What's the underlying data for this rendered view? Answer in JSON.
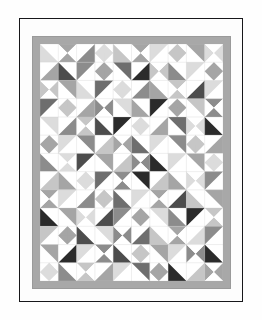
{
  "artwork": {
    "title": "Triangle Pinwheel Quilt",
    "medium": "pattern illustration",
    "frame_color": "#17171a",
    "mat_color": "#fdfdfd",
    "page_background": "#fefefe"
  },
  "quilt": {
    "border_color": "#a8a8a8",
    "field_background": "#ffffff",
    "grid_line_color": "#c8c8c8",
    "columns": 10,
    "rows": 13,
    "cell_size": 18.5,
    "palette": {
      "white": "#ffffff",
      "light": "#dcdcdc",
      "light_mid": "#c6c6c6",
      "mid": "#a5a5a5",
      "mid_dark": "#8c8c8c",
      "dark": "#6e6e6e",
      "darker": "#4d4d4d",
      "near_black": "#2b2b2b"
    },
    "tone_keys": [
      "white",
      "light",
      "light_mid",
      "mid",
      "mid_dark",
      "dark",
      "darker",
      "near_black"
    ],
    "units": [
      {
        "r": 0,
        "c": 0,
        "k": "hst",
        "o": 2,
        "a": "light",
        "b": "white"
      },
      {
        "r": 0,
        "c": 1,
        "k": "hour",
        "o": 0,
        "a": "mid",
        "b": "white"
      },
      {
        "r": 0,
        "c": 2,
        "k": "hst",
        "o": 1,
        "a": "mid_dark",
        "b": "white"
      },
      {
        "r": 0,
        "c": 3,
        "k": "diam",
        "o": 0,
        "a": "light",
        "b": "white"
      },
      {
        "r": 0,
        "c": 4,
        "k": "hst",
        "o": 2,
        "a": "light_mid",
        "b": "white"
      },
      {
        "r": 0,
        "c": 5,
        "k": "hour",
        "o": 0,
        "a": "mid",
        "b": "white"
      },
      {
        "r": 0,
        "c": 6,
        "k": "hst",
        "o": 3,
        "a": "light",
        "b": "white"
      },
      {
        "r": 0,
        "c": 7,
        "k": "diam",
        "o": 0,
        "a": "light_mid",
        "b": "white"
      },
      {
        "r": 0,
        "c": 8,
        "k": "hst",
        "o": 0,
        "a": "mid",
        "b": "white"
      },
      {
        "r": 0,
        "c": 9,
        "k": "hour",
        "o": 1,
        "a": "light",
        "b": "white"
      },
      {
        "r": 1,
        "c": 0,
        "k": "hst",
        "o": 1,
        "a": "mid",
        "b": "white"
      },
      {
        "r": 1,
        "c": 1,
        "k": "hst",
        "o": 2,
        "a": "darker",
        "b": "white"
      },
      {
        "r": 1,
        "c": 2,
        "k": "hst",
        "o": 3,
        "a": "mid_dark",
        "b": "white"
      },
      {
        "r": 1,
        "c": 3,
        "k": "diam",
        "o": 0,
        "a": "mid",
        "b": "white"
      },
      {
        "r": 1,
        "c": 4,
        "k": "hst",
        "o": 0,
        "a": "dark",
        "b": "white"
      },
      {
        "r": 1,
        "c": 5,
        "k": "hst",
        "o": 1,
        "a": "near_black",
        "b": "white"
      },
      {
        "r": 1,
        "c": 6,
        "k": "hour",
        "o": 1,
        "a": "light_mid",
        "b": "white"
      },
      {
        "r": 1,
        "c": 7,
        "k": "hst",
        "o": 2,
        "a": "mid_dark",
        "b": "white"
      },
      {
        "r": 1,
        "c": 8,
        "k": "hst",
        "o": 3,
        "a": "light",
        "b": "white"
      },
      {
        "r": 1,
        "c": 9,
        "k": "diam",
        "o": 0,
        "a": "mid",
        "b": "white"
      },
      {
        "r": 2,
        "c": 0,
        "k": "hour",
        "o": 1,
        "a": "light_mid",
        "b": "white"
      },
      {
        "r": 2,
        "c": 1,
        "k": "hst",
        "o": 0,
        "a": "mid",
        "b": "white"
      },
      {
        "r": 2,
        "c": 2,
        "k": "hst",
        "o": 2,
        "a": "light",
        "b": "white"
      },
      {
        "r": 2,
        "c": 3,
        "k": "hst",
        "o": 3,
        "a": "dark",
        "b": "white"
      },
      {
        "r": 2,
        "c": 4,
        "k": "diam",
        "o": 0,
        "a": "light",
        "b": "white"
      },
      {
        "r": 2,
        "c": 5,
        "k": "hst",
        "o": 1,
        "a": "mid_dark",
        "b": "white"
      },
      {
        "r": 2,
        "c": 6,
        "k": "hst",
        "o": 2,
        "a": "mid",
        "b": "white"
      },
      {
        "r": 2,
        "c": 7,
        "k": "hour",
        "o": 0,
        "a": "light_mid",
        "b": "white"
      },
      {
        "r": 2,
        "c": 8,
        "k": "hst",
        "o": 1,
        "a": "darker",
        "b": "white"
      },
      {
        "r": 2,
        "c": 9,
        "k": "hst",
        "o": 3,
        "a": "light",
        "b": "white"
      },
      {
        "r": 3,
        "c": 0,
        "k": "hst",
        "o": 3,
        "a": "dark",
        "b": "white"
      },
      {
        "r": 3,
        "c": 1,
        "k": "diam",
        "o": 0,
        "a": "light_mid",
        "b": "white"
      },
      {
        "r": 3,
        "c": 2,
        "k": "hst",
        "o": 1,
        "a": "mid",
        "b": "white"
      },
      {
        "r": 3,
        "c": 3,
        "k": "hour",
        "o": 1,
        "a": "mid_dark",
        "b": "white"
      },
      {
        "r": 3,
        "c": 4,
        "k": "hst",
        "o": 0,
        "a": "light",
        "b": "white"
      },
      {
        "r": 3,
        "c": 5,
        "k": "hst",
        "o": 2,
        "a": "mid",
        "b": "white"
      },
      {
        "r": 3,
        "c": 6,
        "k": "hst",
        "o": 3,
        "a": "near_black",
        "b": "white"
      },
      {
        "r": 3,
        "c": 7,
        "k": "diam",
        "o": 0,
        "a": "mid",
        "b": "white"
      },
      {
        "r": 3,
        "c": 8,
        "k": "hst",
        "o": 0,
        "a": "light_mid",
        "b": "white"
      },
      {
        "r": 3,
        "c": 9,
        "k": "hour",
        "o": 0,
        "a": "mid_dark",
        "b": "white"
      },
      {
        "r": 4,
        "c": 0,
        "k": "hst",
        "o": 0,
        "a": "light",
        "b": "white"
      },
      {
        "r": 4,
        "c": 1,
        "k": "hst",
        "o": 1,
        "a": "mid_dark",
        "b": "white"
      },
      {
        "r": 4,
        "c": 2,
        "k": "hour",
        "o": 0,
        "a": "light_mid",
        "b": "white"
      },
      {
        "r": 4,
        "c": 3,
        "k": "hst",
        "o": 2,
        "a": "darker",
        "b": "white"
      },
      {
        "r": 4,
        "c": 4,
        "k": "hst",
        "o": 3,
        "a": "near_black",
        "b": "white"
      },
      {
        "r": 4,
        "c": 5,
        "k": "diam",
        "o": 0,
        "a": "light",
        "b": "white"
      },
      {
        "r": 4,
        "c": 6,
        "k": "hst",
        "o": 1,
        "a": "mid",
        "b": "white"
      },
      {
        "r": 4,
        "c": 7,
        "k": "hst",
        "o": 0,
        "a": "dark",
        "b": "white"
      },
      {
        "r": 4,
        "c": 8,
        "k": "hour",
        "o": 1,
        "a": "light",
        "b": "white"
      },
      {
        "r": 4,
        "c": 9,
        "k": "hst",
        "o": 2,
        "a": "near_black",
        "b": "white"
      },
      {
        "r": 5,
        "c": 0,
        "k": "diam",
        "o": 0,
        "a": "mid",
        "b": "white"
      },
      {
        "r": 5,
        "c": 1,
        "k": "hst",
        "o": 3,
        "a": "light",
        "b": "white"
      },
      {
        "r": 5,
        "c": 2,
        "k": "hst",
        "o": 0,
        "a": "mid_dark",
        "b": "white"
      },
      {
        "r": 5,
        "c": 3,
        "k": "hst",
        "o": 1,
        "a": "light_mid",
        "b": "white"
      },
      {
        "r": 5,
        "c": 4,
        "k": "hour",
        "o": 1,
        "a": "mid",
        "b": "white"
      },
      {
        "r": 5,
        "c": 5,
        "k": "hst",
        "o": 2,
        "a": "dark",
        "b": "white"
      },
      {
        "r": 5,
        "c": 6,
        "k": "hst",
        "o": 3,
        "a": "light",
        "b": "white"
      },
      {
        "r": 5,
        "c": 7,
        "k": "hst",
        "o": 0,
        "a": "mid_dark",
        "b": "white"
      },
      {
        "r": 5,
        "c": 8,
        "k": "diam",
        "o": 0,
        "a": "light_mid",
        "b": "white"
      },
      {
        "r": 5,
        "c": 9,
        "k": "hst",
        "o": 1,
        "a": "mid",
        "b": "white"
      },
      {
        "r": 6,
        "c": 0,
        "k": "hst",
        "o": 2,
        "a": "mid_dark",
        "b": "white"
      },
      {
        "r": 6,
        "c": 1,
        "k": "hour",
        "o": 0,
        "a": "light",
        "b": "white"
      },
      {
        "r": 6,
        "c": 2,
        "k": "hst",
        "o": 3,
        "a": "darker",
        "b": "white"
      },
      {
        "r": 6,
        "c": 3,
        "k": "hst",
        "o": 0,
        "a": "mid",
        "b": "white"
      },
      {
        "r": 6,
        "c": 4,
        "k": "hst",
        "o": 1,
        "a": "light_mid",
        "b": "white"
      },
      {
        "r": 6,
        "c": 5,
        "k": "hour",
        "o": 1,
        "a": "mid_dark",
        "b": "white"
      },
      {
        "r": 6,
        "c": 6,
        "k": "hst",
        "o": 2,
        "a": "near_black",
        "b": "white"
      },
      {
        "r": 6,
        "c": 7,
        "k": "hst",
        "o": 3,
        "a": "light",
        "b": "white"
      },
      {
        "r": 6,
        "c": 8,
        "k": "hst",
        "o": 0,
        "a": "mid",
        "b": "white"
      },
      {
        "r": 6,
        "c": 9,
        "k": "diam",
        "o": 0,
        "a": "light",
        "b": "white"
      },
      {
        "r": 7,
        "c": 0,
        "k": "hst",
        "o": 1,
        "a": "light_mid",
        "b": "white"
      },
      {
        "r": 7,
        "c": 1,
        "k": "hst",
        "o": 2,
        "a": "mid",
        "b": "white"
      },
      {
        "r": 7,
        "c": 2,
        "k": "diam",
        "o": 0,
        "a": "light",
        "b": "white"
      },
      {
        "r": 7,
        "c": 3,
        "k": "hst",
        "o": 3,
        "a": "dark",
        "b": "white"
      },
      {
        "r": 7,
        "c": 4,
        "k": "hour",
        "o": 0,
        "a": "mid_dark",
        "b": "white"
      },
      {
        "r": 7,
        "c": 5,
        "k": "hst",
        "o": 0,
        "a": "near_black",
        "b": "white"
      },
      {
        "r": 7,
        "c": 6,
        "k": "hst",
        "o": 1,
        "a": "light_mid",
        "b": "white"
      },
      {
        "r": 7,
        "c": 7,
        "k": "hst",
        "o": 2,
        "a": "mid",
        "b": "white"
      },
      {
        "r": 7,
        "c": 8,
        "k": "hour",
        "o": 1,
        "a": "light",
        "b": "white"
      },
      {
        "r": 7,
        "c": 9,
        "k": "hst",
        "o": 3,
        "a": "mid_dark",
        "b": "white"
      },
      {
        "r": 8,
        "c": 0,
        "k": "hour",
        "o": 0,
        "a": "mid",
        "b": "white"
      },
      {
        "r": 8,
        "c": 1,
        "k": "hst",
        "o": 3,
        "a": "light",
        "b": "white"
      },
      {
        "r": 8,
        "c": 2,
        "k": "hst",
        "o": 1,
        "a": "mid_dark",
        "b": "white"
      },
      {
        "r": 8,
        "c": 3,
        "k": "diam",
        "o": 0,
        "a": "light_mid",
        "b": "white"
      },
      {
        "r": 8,
        "c": 4,
        "k": "hst",
        "o": 2,
        "a": "dark",
        "b": "white"
      },
      {
        "r": 8,
        "c": 5,
        "k": "hst",
        "o": 3,
        "a": "light",
        "b": "white"
      },
      {
        "r": 8,
        "c": 6,
        "k": "hour",
        "o": 0,
        "a": "mid",
        "b": "white"
      },
      {
        "r": 8,
        "c": 7,
        "k": "hst",
        "o": 1,
        "a": "darker",
        "b": "white"
      },
      {
        "r": 8,
        "c": 8,
        "k": "hst",
        "o": 2,
        "a": "light_mid",
        "b": "white"
      },
      {
        "r": 8,
        "c": 9,
        "k": "hst",
        "o": 0,
        "a": "mid",
        "b": "white"
      },
      {
        "r": 9,
        "c": 0,
        "k": "hst",
        "o": 2,
        "a": "near_black",
        "b": "white"
      },
      {
        "r": 9,
        "c": 1,
        "k": "hst",
        "o": 0,
        "a": "mid",
        "b": "white"
      },
      {
        "r": 9,
        "c": 2,
        "k": "hour",
        "o": 1,
        "a": "light",
        "b": "white"
      },
      {
        "r": 9,
        "c": 3,
        "k": "hst",
        "o": 1,
        "a": "darker",
        "b": "white"
      },
      {
        "r": 9,
        "c": 4,
        "k": "hst",
        "o": 3,
        "a": "mid_dark",
        "b": "white"
      },
      {
        "r": 9,
        "c": 5,
        "k": "diam",
        "o": 0,
        "a": "mid",
        "b": "white"
      },
      {
        "r": 9,
        "c": 6,
        "k": "hst",
        "o": 0,
        "a": "light",
        "b": "white"
      },
      {
        "r": 9,
        "c": 7,
        "k": "hst",
        "o": 2,
        "a": "mid_dark",
        "b": "white"
      },
      {
        "r": 9,
        "c": 8,
        "k": "hst",
        "o": 3,
        "a": "near_black",
        "b": "white"
      },
      {
        "r": 9,
        "c": 9,
        "k": "hour",
        "o": 0,
        "a": "light_mid",
        "b": "white"
      },
      {
        "r": 10,
        "c": 0,
        "k": "hst",
        "o": 3,
        "a": "light_mid",
        "b": "white"
      },
      {
        "r": 10,
        "c": 1,
        "k": "diam",
        "o": 0,
        "a": "mid",
        "b": "white"
      },
      {
        "r": 10,
        "c": 2,
        "k": "hst",
        "o": 2,
        "a": "darker",
        "b": "white"
      },
      {
        "r": 10,
        "c": 3,
        "k": "hst",
        "o": 0,
        "a": "light",
        "b": "white"
      },
      {
        "r": 10,
        "c": 4,
        "k": "hour",
        "o": 1,
        "a": "mid_dark",
        "b": "white"
      },
      {
        "r": 10,
        "c": 5,
        "k": "hst",
        "o": 1,
        "a": "dark",
        "b": "white"
      },
      {
        "r": 10,
        "c": 6,
        "k": "hst",
        "o": 2,
        "a": "light_mid",
        "b": "white"
      },
      {
        "r": 10,
        "c": 7,
        "k": "hour",
        "o": 0,
        "a": "mid",
        "b": "white"
      },
      {
        "r": 10,
        "c": 8,
        "k": "hst",
        "o": 1,
        "a": "light",
        "b": "white"
      },
      {
        "r": 10,
        "c": 9,
        "k": "hst",
        "o": 3,
        "a": "mid_dark",
        "b": "white"
      },
      {
        "r": 11,
        "c": 0,
        "k": "hst",
        "o": 0,
        "a": "mid",
        "b": "white"
      },
      {
        "r": 11,
        "c": 1,
        "k": "hst",
        "o": 1,
        "a": "near_black",
        "b": "white"
      },
      {
        "r": 11,
        "c": 2,
        "k": "hst",
        "o": 3,
        "a": "light",
        "b": "white"
      },
      {
        "r": 11,
        "c": 3,
        "k": "hour",
        "o": 0,
        "a": "mid_dark",
        "b": "white"
      },
      {
        "r": 11,
        "c": 4,
        "k": "hst",
        "o": 2,
        "a": "darker",
        "b": "white"
      },
      {
        "r": 11,
        "c": 5,
        "k": "diam",
        "o": 0,
        "a": "light_mid",
        "b": "white"
      },
      {
        "r": 11,
        "c": 6,
        "k": "hst",
        "o": 0,
        "a": "mid",
        "b": "white"
      },
      {
        "r": 11,
        "c": 7,
        "k": "hst",
        "o": 3,
        "a": "light",
        "b": "white"
      },
      {
        "r": 11,
        "c": 8,
        "k": "hour",
        "o": 1,
        "a": "mid_dark",
        "b": "white"
      },
      {
        "r": 11,
        "c": 9,
        "k": "hst",
        "o": 2,
        "a": "near_black",
        "b": "white"
      },
      {
        "r": 12,
        "c": 0,
        "k": "diam",
        "o": 0,
        "a": "light",
        "b": "white"
      },
      {
        "r": 12,
        "c": 1,
        "k": "hst",
        "o": 2,
        "a": "mid_dark",
        "b": "white"
      },
      {
        "r": 12,
        "c": 2,
        "k": "hour",
        "o": 0,
        "a": "light_mid",
        "b": "white"
      },
      {
        "r": 12,
        "c": 3,
        "k": "hst",
        "o": 1,
        "a": "mid",
        "b": "white"
      },
      {
        "r": 12,
        "c": 4,
        "k": "hst",
        "o": 3,
        "a": "light",
        "b": "white"
      },
      {
        "r": 12,
        "c": 5,
        "k": "hst",
        "o": 0,
        "a": "dark",
        "b": "white"
      },
      {
        "r": 12,
        "c": 6,
        "k": "diam",
        "o": 0,
        "a": "mid",
        "b": "white"
      },
      {
        "r": 12,
        "c": 7,
        "k": "hst",
        "o": 2,
        "a": "near_black",
        "b": "white"
      },
      {
        "r": 12,
        "c": 8,
        "k": "hst",
        "o": 1,
        "a": "light_mid",
        "b": "white"
      },
      {
        "r": 12,
        "c": 9,
        "k": "hour",
        "o": 1,
        "a": "mid",
        "b": "white"
      }
    ]
  }
}
